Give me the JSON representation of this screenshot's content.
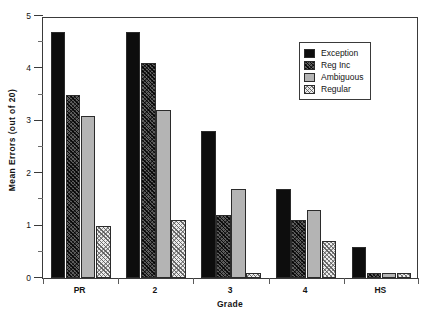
{
  "chart_data": {
    "type": "bar",
    "title": "",
    "xlabel": "Grade",
    "ylabel": "Mean Errors (out of 20)",
    "categories": [
      "PR",
      "2",
      "3",
      "4",
      "HS"
    ],
    "ylim": [
      0,
      5
    ],
    "yticks": [
      0,
      1,
      2,
      3,
      4,
      5
    ],
    "ytick_labels": [
      "0",
      "1",
      "2",
      "3",
      "4",
      "5"
    ],
    "yminor_ticks": [
      0.5,
      1.5,
      2.5,
      3.5,
      4.5
    ],
    "grid": false,
    "legend_position": "upper right",
    "series": [
      {
        "name": "Exception",
        "values": [
          4.7,
          4.7,
          2.8,
          1.7,
          0.6
        ],
        "fill": "solid-black",
        "color": "#0d0d0d"
      },
      {
        "name": "Reg Inc",
        "values": [
          3.5,
          4.1,
          1.2,
          1.1,
          0.1
        ],
        "fill": "dark-crosshatch",
        "color": "#5e5e5e"
      },
      {
        "name": "Ambiguous",
        "values": [
          3.1,
          3.2,
          1.7,
          1.3,
          0.1
        ],
        "fill": "solid-gray",
        "color": "#b4b4b4"
      },
      {
        "name": "Regular",
        "values": [
          1.0,
          1.1,
          0.1,
          0.7,
          0.1
        ],
        "fill": "light-crosshatch",
        "color": "#ededed"
      }
    ]
  },
  "legend": {
    "entries": [
      "Exception",
      "Reg Inc",
      "Ambiguous",
      "Regular"
    ]
  },
  "axes": {
    "x_title": "Grade",
    "y_title": "Mean Errors (out of 20)"
  }
}
